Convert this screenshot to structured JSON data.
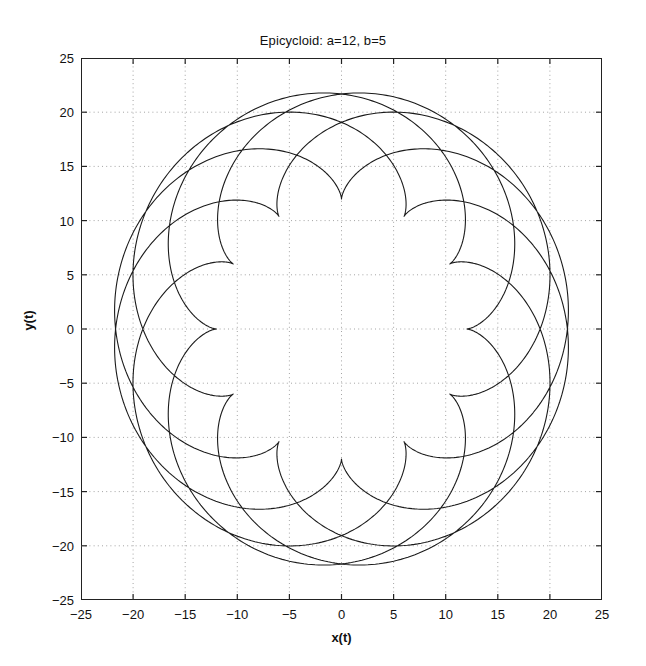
{
  "figure": {
    "background_color": "#ffffff",
    "axes_color": "#222222",
    "curve_color": "#1a1a1a",
    "grid_color": "#9a9a9a"
  },
  "chart_data": {
    "type": "line",
    "title": "Epicycloid: a=12, b=5",
    "xlabel": "x(t)",
    "ylabel": "y(t)",
    "xlim": [
      -25,
      25
    ],
    "ylim": [
      -25,
      25
    ],
    "xticks": [
      -25,
      -20,
      -15,
      -10,
      -5,
      0,
      5,
      10,
      15,
      20,
      25
    ],
    "yticks": [
      -25,
      -20,
      -15,
      -10,
      -5,
      0,
      5,
      10,
      15,
      20,
      25
    ],
    "xtick_labels": [
      "-25",
      "-20",
      "-15",
      "-10",
      "-5",
      "0",
      "5",
      "10",
      "15",
      "20",
      "25"
    ],
    "ytick_labels": [
      "-25",
      "-20",
      "-15",
      "-10",
      "-5",
      "0",
      "5",
      "10",
      "15",
      "20",
      "25"
    ],
    "grid": true,
    "grid_style": "dotted",
    "legend": null,
    "series": [
      {
        "name": "epicycloid",
        "curve_type": "epicycloid",
        "parameters": {
          "a": 12,
          "b": 5
        },
        "equations": {
          "x": "(a+b)*cos(t) - b*cos(((a+b)/b)*t)",
          "y": "(a+b)*sin(t) - b*sin(((a+b)/b)*t)"
        },
        "t_range": [
          0,
          31.41592653589793
        ],
        "t_samples": 3000,
        "cusp_count": 12,
        "cusp_radius": 12,
        "outer_radius": 22,
        "color": "#1a1a1a",
        "line_width": 1.1
      }
    ]
  }
}
